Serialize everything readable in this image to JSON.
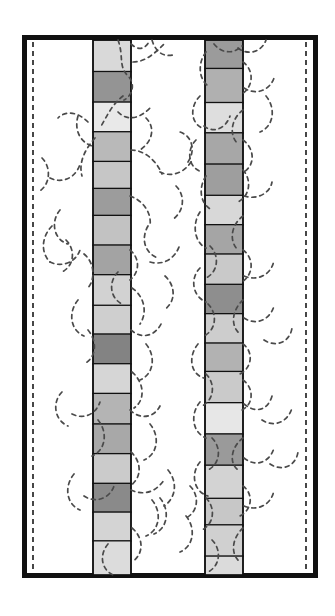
{
  "figure": {
    "background_color": "#ffffff",
    "width": 335,
    "height": 616
  },
  "frame": {
    "name": "outer-rectangle",
    "x": 22,
    "y": 35,
    "width": 296,
    "height": 543,
    "stroke_color": "#111111",
    "stroke_width": 5,
    "fill_color": "#ffffff"
  },
  "guides": {
    "stroke_color": "#1a1a1a",
    "stroke_width": 1.6,
    "dash": "5,4",
    "lines": [
      {
        "name": "left-dashed-guide",
        "x": 33,
        "y1": 42,
        "y2": 571
      },
      {
        "name": "right-dashed-guide",
        "x": 306,
        "y1": 42,
        "y2": 571
      }
    ]
  },
  "columns": [
    {
      "name": "left-column",
      "x": 93,
      "width": 38,
      "top": 40,
      "bottom": 575,
      "outline_color": "#111111",
      "outline_width": 1.3,
      "segments": [
        {
          "index": 1,
          "height": 35,
          "fill": "#d9d9d9"
        },
        {
          "index": 2,
          "height": 34,
          "fill": "#949494"
        },
        {
          "index": 3,
          "height": 33,
          "fill": "#e9e9e9"
        },
        {
          "index": 4,
          "height": 33,
          "fill": "#b9b9b9"
        },
        {
          "index": 5,
          "height": 30,
          "fill": "#c6c6c6"
        },
        {
          "index": 6,
          "height": 30,
          "fill": "#9c9c9c"
        },
        {
          "index": 7,
          "height": 33,
          "fill": "#c2c2c2"
        },
        {
          "index": 8,
          "height": 33,
          "fill": "#a3a3a3"
        },
        {
          "index": 9,
          "height": 34,
          "fill": "#d2d2d2"
        },
        {
          "index": 10,
          "height": 32,
          "fill": "#cfcfcf"
        },
        {
          "index": 11,
          "height": 33,
          "fill": "#838383"
        },
        {
          "index": 12,
          "height": 33,
          "fill": "#d6d6d6"
        },
        {
          "index": 13,
          "height": 34,
          "fill": "#b4b4b4"
        },
        {
          "index": 14,
          "height": 33,
          "fill": "#a8a8a8"
        },
        {
          "index": 15,
          "height": 33,
          "fill": "#cbcbcb"
        },
        {
          "index": 16,
          "height": 32,
          "fill": "#8a8a8a"
        },
        {
          "index": 17,
          "height": 32,
          "fill": "#d4d4d4"
        },
        {
          "index": 18,
          "height": 38,
          "fill": "#dcdcdc"
        }
      ]
    },
    {
      "name": "right-column",
      "x": 205,
      "width": 38,
      "top": 40,
      "bottom": 575,
      "outline_color": "#111111",
      "outline_width": 1.3,
      "segments": [
        {
          "index": 1,
          "height": 30,
          "fill": "#9b9b9b"
        },
        {
          "index": 2,
          "height": 36,
          "fill": "#b0b0b0"
        },
        {
          "index": 3,
          "height": 32,
          "fill": "#dedede"
        },
        {
          "index": 4,
          "height": 33,
          "fill": "#a7a7a7"
        },
        {
          "index": 5,
          "height": 33,
          "fill": "#9e9e9e"
        },
        {
          "index": 6,
          "height": 31,
          "fill": "#d8d8d8"
        },
        {
          "index": 7,
          "height": 31,
          "fill": "#a5a5a5"
        },
        {
          "index": 8,
          "height": 32,
          "fill": "#c9c9c9"
        },
        {
          "index": 9,
          "height": 31,
          "fill": "#8e8e8e"
        },
        {
          "index": 10,
          "height": 31,
          "fill": "#cdcdcd"
        },
        {
          "index": 11,
          "height": 30,
          "fill": "#b2b2b2"
        },
        {
          "index": 12,
          "height": 33,
          "fill": "#cacaca"
        },
        {
          "index": 13,
          "height": 33,
          "fill": "#e7e7e7"
        },
        {
          "index": 14,
          "height": 33,
          "fill": "#9a9a9a"
        },
        {
          "index": 15,
          "height": 35,
          "fill": "#d3d3d3"
        },
        {
          "index": 16,
          "height": 28,
          "fill": "#c7c7c7"
        },
        {
          "index": 17,
          "height": 33,
          "fill": "#d0d0d0"
        },
        {
          "index": 18,
          "height": 20,
          "fill": "#dbdbdb"
        }
      ]
    }
  ],
  "roots": {
    "name": "dashed-root-network",
    "stroke_color": "#4a4a4a",
    "stroke_width": 1.7,
    "dash": "4,4",
    "paths": [
      "M118,40 C124,56 118,66 128,76 C136,84 132,96 124,100",
      "M131,44 C140,52 146,48 150,40",
      "M133,62 C146,62 156,52 164,44",
      "M152,40 C156,54 166,58 176,54",
      "M123,96 C112,104 106,118 100,128",
      "M118,112 C128,122 140,118 150,108",
      "M146,118 C156,128 152,142 140,150",
      "M88,122 C78,112 66,110 58,118",
      "M78,116 C74,130 80,142 92,146",
      "M95,138 C86,148 78,162 82,176",
      "M131,150 C144,150 156,160 162,174",
      "M160,172 C172,178 186,172 192,160",
      "M188,162 C196,150 192,136 180,132",
      "M176,186 C186,196 184,212 172,220",
      "M130,196 C142,200 152,212 150,226",
      "M148,226 C140,240 146,254 158,258",
      "M52,226 C42,236 40,252 50,262",
      "M50,262 C62,268 76,262 80,250",
      "M84,254 C94,262 96,278 88,288",
      "M130,250 C140,258 140,272 130,280",
      "M118,272 C108,282 110,298 122,304",
      "M150,262 C164,266 176,258 180,244",
      "M165,276 C176,286 176,302 164,310",
      "M132,288 C144,296 148,312 140,324",
      "M78,300 C68,312 70,330 84,336",
      "M88,330 C98,342 96,358 84,364",
      "M131,330 C142,340 156,336 162,322",
      "M146,344 C156,356 154,374 140,380",
      "M132,372 C144,382 146,400 134,408",
      "M62,392 C52,402 54,420 68,426",
      "M72,414 C84,420 96,414 100,402",
      "M98,420 C108,432 106,450 92,456",
      "M130,410 C140,420 154,418 160,406",
      "M150,424 C160,436 158,454 144,460",
      "M131,452 C142,462 142,478 130,486",
      "M74,474 C64,486 66,504 80,510",
      "M84,496 C96,504 110,498 114,486",
      "M131,490 C144,496 156,492 164,480",
      "M152,500 C162,512 160,530 146,536",
      "M132,528 C144,538 144,554 132,562",
      "M108,544 C98,556 102,572 116,576",
      "M206,52 C198,62 198,78 208,86",
      "M214,44 C222,54 234,54 242,46",
      "M238,48 C248,56 262,52 266,40",
      "M243,62 C254,70 254,86 242,94",
      "M244,88 C256,96 270,90 274,78",
      "M266,96 C276,108 274,126 260,132",
      "M243,110 C232,118 228,134 238,144",
      "M200,96 C190,106 190,122 202,128",
      "M204,126 C214,134 226,128 230,116",
      "M243,140 C254,148 256,164 244,172",
      "M196,140 C186,150 188,168 202,172",
      "M243,170 C252,180 250,196 238,202",
      "M206,176 C198,188 200,204 212,210",
      "M244,196 C256,200 270,194 272,182",
      "M243,216 C232,224 228,240 238,250",
      "M200,212 C192,224 194,242 206,248",
      "M210,246 C220,256 218,272 206,278",
      "M243,250 C254,258 254,274 242,282",
      "M244,276 C258,282 272,274 274,260",
      "M200,268 C190,278 192,296 206,302",
      "M243,300 C232,310 230,326 240,334",
      "M208,304 C218,314 216,330 204,336",
      "M244,318 C256,326 270,320 274,306",
      "M243,344 C254,352 252,368 240,374",
      "M198,344 C188,356 190,374 204,378",
      "M206,374 C216,384 214,400 202,406",
      "M243,380 C254,388 254,404 242,410",
      "M244,404 C256,414 268,410 272,396",
      "M200,402 C190,414 192,432 206,438",
      "M243,438 C232,446 228,462 238,470",
      "M212,438 C222,448 220,464 208,470",
      "M244,458 C256,468 270,462 274,448",
      "M200,462 C190,474 194,492 208,496",
      "M243,486 C254,494 252,510 240,516",
      "M206,498 C216,508 214,524 202,530",
      "M244,506 C258,512 272,504 274,490",
      "M243,528 C232,538 230,554 240,562",
      "M212,540 C222,550 220,566 208,572",
      "M168,470 C178,482 176,498 164,506",
      "M160,498 C170,510 168,528 154,534",
      "M190,486 C200,496 198,512 186,518",
      "M186,516 C196,528 194,546 180,552",
      "M264,340 C276,348 290,342 292,328",
      "M262,420 C274,428 288,422 292,408",
      "M270,464 C282,472 296,466 298,452",
      "M60,210 C50,222 54,240 68,244",
      "M66,240 C76,250 74,266 62,272",
      "M42,158 C52,168 50,186 38,192",
      "M50,178 C62,184 76,178 80,164"
    ]
  }
}
